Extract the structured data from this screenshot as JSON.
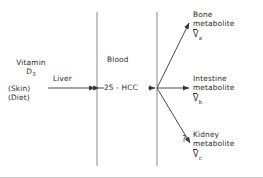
{
  "diagram": {
    "colors": {
      "line": "#6e6e6e",
      "text": "#2b2b2b",
      "background": "#ffffff",
      "border": "#c9c9c9"
    },
    "compartments": [
      {
        "id": "blood",
        "label": "Blood"
      }
    ],
    "nodes": {
      "source_line1": "Vitamin",
      "source_line2": "D",
      "source_sub": "3",
      "source_note1": "(Skin)",
      "source_note2": "(Diet)",
      "process_label": "Liver",
      "blood_metabolite": "25 - HCC",
      "question": "?"
    },
    "outputs": [
      {
        "id": "bone",
        "line1": "Bone",
        "line2": "metabolite",
        "symbol_letter": "V",
        "symbol_subscript": "a",
        "arrow": "up-diagonal"
      },
      {
        "id": "intestine",
        "line1": "Intestine",
        "line2": "metabolite",
        "symbol_letter": "V",
        "symbol_subscript": "b",
        "arrow": "horizontal"
      },
      {
        "id": "kidney",
        "line1": "Kidney",
        "line2": "metabolite",
        "symbol_letter": "V",
        "symbol_subscript": "c",
        "arrow": "down-diagonal"
      }
    ]
  }
}
